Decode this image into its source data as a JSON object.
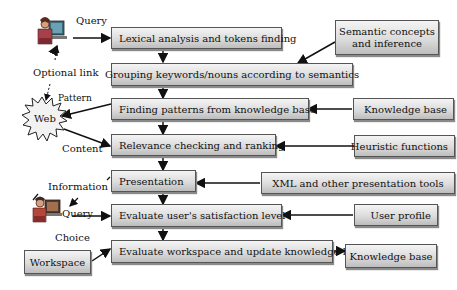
{
  "process_steps": [
    {
      "id": "lexical",
      "label": "Lexical analysis and tokens finding"
    },
    {
      "id": "grouping",
      "label": "Grouping keywords/nouns according to semantics"
    },
    {
      "id": "patterns",
      "label": "Finding patterns from knowledge base"
    },
    {
      "id": "relevance",
      "label": "Relevance checking and ranking"
    },
    {
      "id": "presentation",
      "label": "Presentation"
    },
    {
      "id": "satisfaction",
      "label": "Evaluate user's satisfaction level"
    },
    {
      "id": "workspace_update",
      "label": "Evaluate workspace and update knowledge base"
    }
  ],
  "inputs": [
    {
      "id": "semantic",
      "label": "Semantic concepts and inference",
      "line1": "Semantic concepts",
      "line2": "and inference"
    },
    {
      "id": "kb1",
      "label": "Knowledge base"
    },
    {
      "id": "heuristic",
      "label": "Heuristic functions"
    },
    {
      "id": "xml",
      "label": "XML and other presentation tools"
    },
    {
      "id": "profile",
      "label": "User profile"
    },
    {
      "id": "kb2",
      "label": "Knowledge base"
    }
  ],
  "workspace": {
    "label": "Workspace"
  },
  "web": {
    "label": "Web"
  },
  "annotations": {
    "query_top": "Query",
    "optional_link": "Optional link",
    "pattern": "Pattern",
    "content": "Content",
    "information": "Information",
    "query_bottom": "Query",
    "choice": "Choice"
  }
}
